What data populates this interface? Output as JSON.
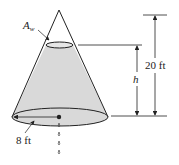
{
  "diagram": {
    "labels": {
      "water_area": "A",
      "water_area_sub": "w",
      "height_variable": "h",
      "total_height": "20 ft",
      "base_radius": "8 ft"
    },
    "colors": {
      "fill": "#d9d9d9",
      "stroke": "#222222",
      "background": "#ffffff"
    }
  }
}
